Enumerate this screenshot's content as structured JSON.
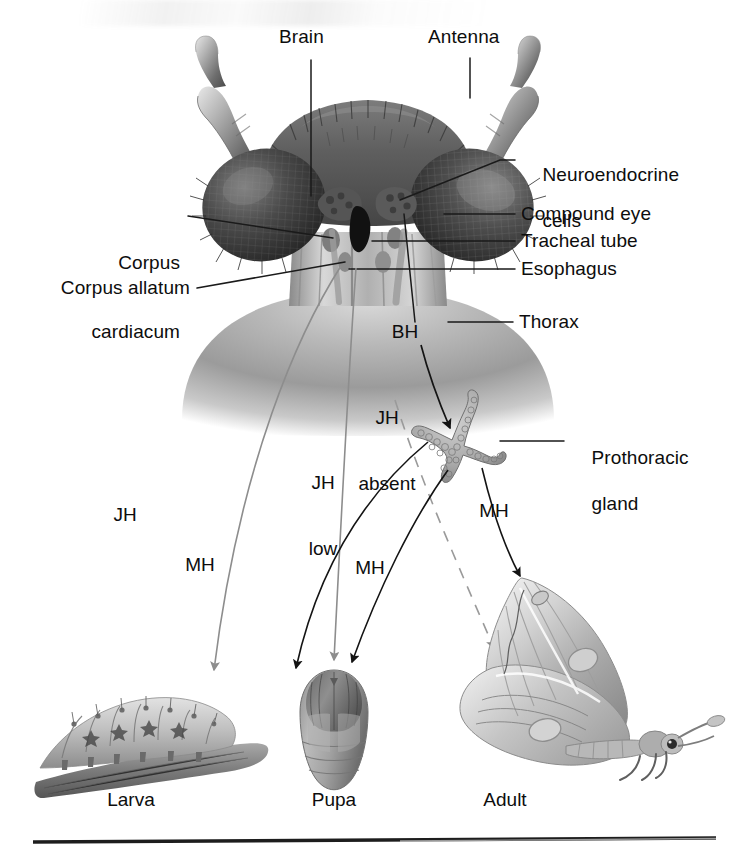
{
  "figure": {
    "background_color": "#ffffff",
    "text_color": "#0d0d0d"
  },
  "anatomy_labels": [
    {
      "id": "brain",
      "text": "Brain",
      "side": "top"
    },
    {
      "id": "antenna",
      "text": "Antenna",
      "side": "top"
    },
    {
      "id": "neuroendocrine-cells",
      "line1": "Neuroendocrine",
      "line2": "cells",
      "side": "right"
    },
    {
      "id": "compound-eye",
      "text": "Compound eye",
      "side": "right"
    },
    {
      "id": "tracheal-tube",
      "text": "Tracheal tube",
      "side": "right"
    },
    {
      "id": "esophagus",
      "text": "Esophagus",
      "side": "right"
    },
    {
      "id": "thorax",
      "text": "Thorax",
      "side": "right"
    },
    {
      "id": "corpus-cardiacum",
      "line1": "Corpus",
      "line2": "cardiacum",
      "side": "left"
    },
    {
      "id": "corpus-allatum",
      "text": "Corpus allatum",
      "side": "left"
    },
    {
      "id": "prothoracic-gland",
      "line1": "Prothoracic",
      "line2": "gland",
      "side": "right"
    }
  ],
  "hormone_labels": [
    {
      "id": "bh",
      "text": "BH",
      "meaning": "brain hormone"
    },
    {
      "id": "jh-absent",
      "line1": "JH",
      "line2": "absent"
    },
    {
      "id": "jh-low",
      "line1": "JH",
      "line2": "low"
    },
    {
      "id": "jh",
      "text": "JH",
      "meaning": "juvenile hormone"
    },
    {
      "id": "mh-larva",
      "text": "MH",
      "meaning": "molting hormone"
    },
    {
      "id": "mh-pupa",
      "text": "MH",
      "meaning": "molting hormone"
    },
    {
      "id": "mh-adult",
      "text": "MH",
      "meaning": "molting hormone"
    }
  ],
  "stages": [
    {
      "id": "larva",
      "label": "Larva"
    },
    {
      "id": "pupa",
      "label": "Pupa"
    },
    {
      "id": "adult",
      "label": "Adult"
    }
  ],
  "colors": {
    "leader_line": "#1a1a1a",
    "jh_arrow": "#8a8a8a",
    "mh_arrow": "#1a1a1a",
    "dashed_arrow": "#9a9a9a",
    "rule": "#111111"
  }
}
